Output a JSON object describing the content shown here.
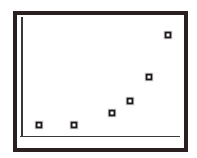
{
  "figure": {
    "width": 197,
    "height": 158,
    "background_color": "#ffffff",
    "frame_color": "#2a2020",
    "axis_color": "#3a3a3a",
    "marker_color": "#1e1a1a",
    "marker_fill_color": "#ffffff",
    "frame_label": "plot frame",
    "area_label": "plot area",
    "y_axis_label": "y axis line",
    "x_axis_label": "x axis line"
  },
  "chart_data": {
    "type": "scatter",
    "title": "",
    "subtitle": "",
    "xlabel": "",
    "ylabel": "",
    "grid": false,
    "legend": null,
    "legend_position": "none",
    "xlim": [
      0,
      10
    ],
    "ylim": [
      0,
      10
    ],
    "xticks": [],
    "yticks": [],
    "xticklabels": [],
    "yticklabels": [],
    "annotations": [],
    "marker": "square",
    "series": [
      {
        "name": "",
        "points": [
          {
            "x": 1.2,
            "y": 0.75,
            "px": 39,
            "py": 125
          },
          {
            "x": 3.4,
            "y": 0.75,
            "px": 74,
            "py": 125
          },
          {
            "x": 5.8,
            "y": 1.8,
            "px": 112,
            "py": 113
          },
          {
            "x": 6.9,
            "y": 2.9,
            "px": 130,
            "py": 101
          },
          {
            "x": 8.1,
            "y": 4.9,
            "px": 149,
            "py": 77
          },
          {
            "x": 9.3,
            "y": 8.5,
            "px": 168,
            "py": 35
          }
        ]
      }
    ]
  }
}
